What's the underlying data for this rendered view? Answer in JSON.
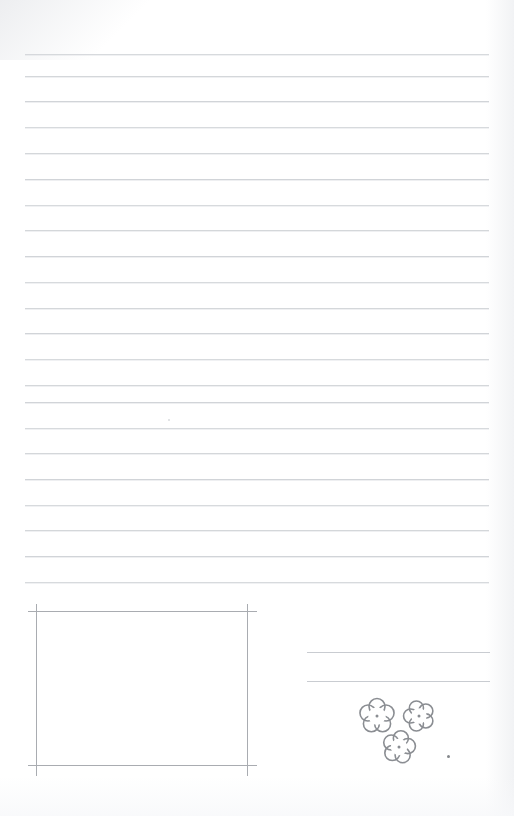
{
  "document": {
    "type": "scanned-lined-worksheet",
    "title": "Blank lined notebook page",
    "page_width": 514,
    "page_height": 816,
    "background_color": "#ffffff",
    "rule_color": "#cfd2d6",
    "box_color": "#a9acb1",
    "doodle_color": "#8a8d92"
  },
  "ruled_area": {
    "name": "writing-lines",
    "line_left": 25,
    "line_right": 489,
    "line_count": 22,
    "line_spacing": 25.7,
    "first_line_y": 54,
    "lines_y": [
      54,
      76,
      101,
      127,
      153,
      179,
      205,
      230,
      256,
      282,
      308,
      333,
      359,
      385,
      402,
      428,
      453,
      479,
      505,
      530,
      556,
      582
    ]
  },
  "answer_box": {
    "name": "drawing-box",
    "left": 36,
    "top": 611,
    "right": 247,
    "bottom": 765,
    "overhang": 9,
    "label": ""
  },
  "right_lines": {
    "name": "short-answer-lines",
    "left": 307,
    "right": 490,
    "lines_y": [
      652,
      681
    ],
    "count": 2
  },
  "doodles": {
    "name": "flower-doodles",
    "count": 3,
    "petals_per_flower": 5,
    "items": [
      {
        "name": "flower-doodle-1",
        "cx": 377,
        "cy": 716,
        "r": 17
      },
      {
        "name": "flower-doodle-2",
        "cx": 419,
        "cy": 716,
        "r": 15
      },
      {
        "name": "flower-doodle-3",
        "cx": 399,
        "cy": 747,
        "r": 16
      }
    ]
  },
  "marks": {
    "ink_speck": {
      "name": "ink-speck",
      "x": 447,
      "y": 755
    },
    "faint_speck": {
      "name": "faint-speck",
      "x": 168,
      "y": 419
    }
  }
}
